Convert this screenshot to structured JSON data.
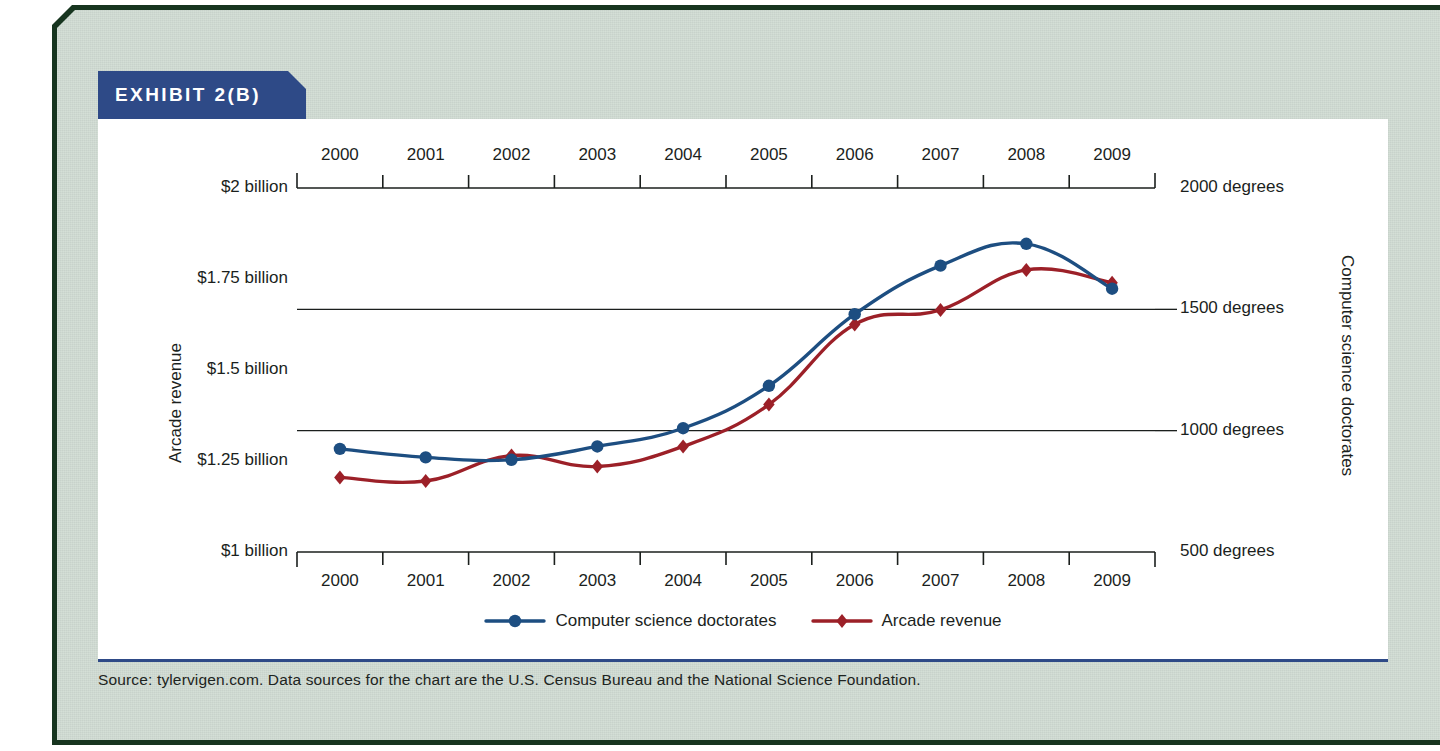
{
  "exhibit": {
    "banner_label": "EXHIBIT 2(B)",
    "source_note": "Source: tylervigen.com. Data sources for the chart are the U.S. Census Bureau and the National Science Foundation."
  },
  "colors": {
    "banner_navy": "#2e4a87",
    "frame_green": "#17351f",
    "card_background": "#ccd8cf",
    "series_blue": "#1d4e81",
    "series_red": "#9c2028",
    "axis_black": "#1b1f1d"
  },
  "chart_data": {
    "type": "line",
    "title": "EXHIBIT 2(B)",
    "xlabel": "",
    "ylabel": "Arcade revenue",
    "y2label": "Computer science doctorates",
    "categories": [
      "2000",
      "2001",
      "2002",
      "2003",
      "2004",
      "2005",
      "2006",
      "2007",
      "2008",
      "2009"
    ],
    "x_tick_labels_top": [
      "2000",
      "2001",
      "2002",
      "2003",
      "2004",
      "2005",
      "2006",
      "2007",
      "2008",
      "2009"
    ],
    "x_tick_labels_bottom": [
      "2000",
      "2001",
      "2002",
      "2003",
      "2004",
      "2005",
      "2006",
      "2007",
      "2008",
      "2009"
    ],
    "ylim": [
      1.0,
      2.0
    ],
    "y_tick_labels": [
      "$2 billion",
      "$1.75 billion",
      "$1.5 billion",
      "$1.25 billion",
      "$1 billion"
    ],
    "y_tick_values": [
      2.0,
      1.75,
      1.5,
      1.25,
      1.0
    ],
    "y2lim": [
      500,
      2000
    ],
    "y2_tick_labels": [
      "2000 degrees",
      "1500 degrees",
      "1000 degrees",
      "500 degrees"
    ],
    "y2_tick_values": [
      2000,
      1500,
      1000,
      500
    ],
    "gridline_values_right": [
      1500,
      1000
    ],
    "grid": true,
    "legend_position": "bottom-center",
    "series": [
      {
        "name": "Computer science doctorates",
        "axis": "right",
        "color": "#1d4e81",
        "marker": "circle",
        "unit": "degrees",
        "values": [
          925,
          890,
          880,
          935,
          1010,
          1185,
          1480,
          1680,
          1770,
          1585
        ]
      },
      {
        "name": "Arcade revenue",
        "axis": "left",
        "color": "#9c2028",
        "marker": "diamond",
        "unit": "billion USD",
        "values": [
          1.205,
          1.195,
          1.265,
          1.235,
          1.29,
          1.405,
          1.625,
          1.665,
          1.775,
          1.74
        ]
      }
    ]
  }
}
